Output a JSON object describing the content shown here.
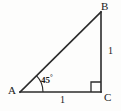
{
  "figure": {
    "type": "geometry-diagram",
    "background_color": "#fdfdfc",
    "stroke_color": "#2b2b2b",
    "text_color": "#1a1a1a",
    "width": 121,
    "height": 111
  },
  "vertices": [
    {
      "name": "A",
      "label": "A",
      "x": 20,
      "y": 92
    },
    {
      "name": "B",
      "label": "B",
      "x": 101,
      "y": 12
    },
    {
      "name": "C",
      "label": "C",
      "x": 101,
      "y": 92
    }
  ],
  "sides": [
    {
      "name": "AC",
      "label": "1",
      "position": "bottom"
    },
    {
      "name": "BC",
      "label": "1",
      "position": "right"
    },
    {
      "name": "AB",
      "label": "",
      "position": "hypotenuse"
    }
  ],
  "angles": [
    {
      "at": "A",
      "label": "45",
      "degree_symbol": "°",
      "marker": "arc"
    },
    {
      "at": "C",
      "label": "",
      "degree_symbol": "",
      "marker": "right-angle-square"
    }
  ]
}
